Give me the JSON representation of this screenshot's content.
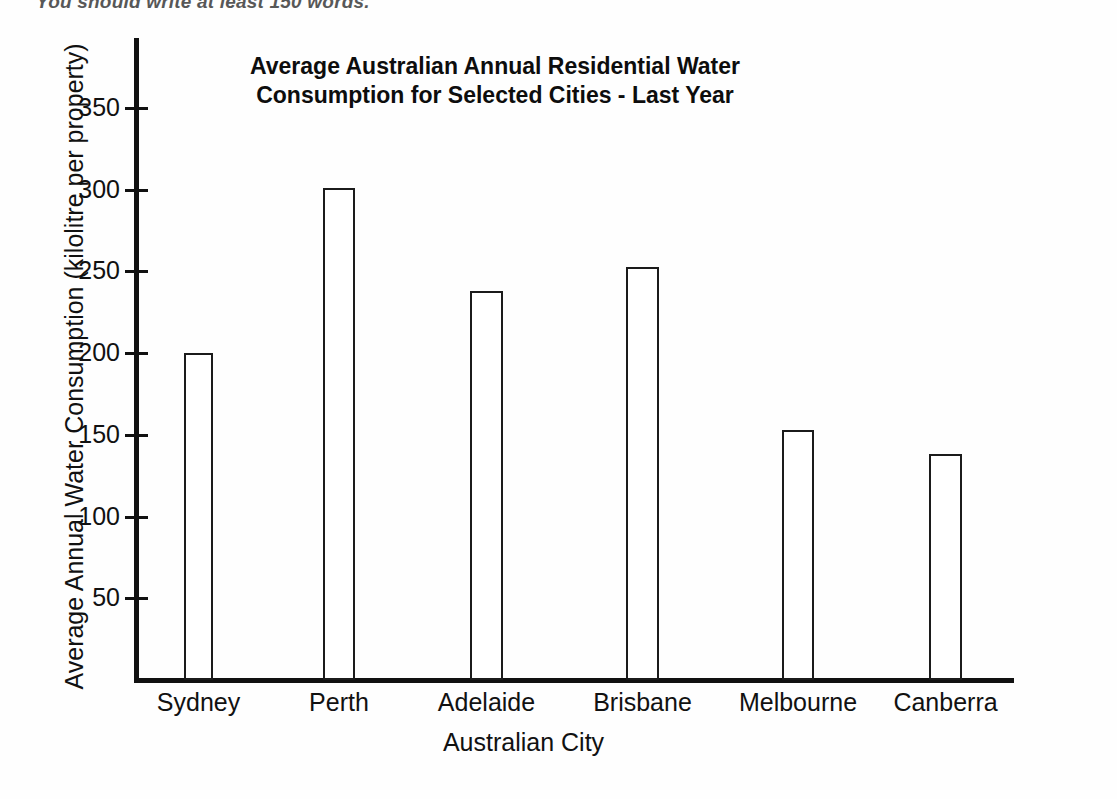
{
  "page": {
    "top_instruction": "You should write at least 150 words."
  },
  "chart_data": {
    "type": "bar",
    "title": "Average Australian Annual Residential Water Consumption for Selected Cities - Last Year",
    "title_line1": "Average Australian Annual Residential Water",
    "title_line2": "Consumption for Selected Cities - Last Year",
    "xlabel": "Australian City",
    "ylabel": "Average Annual Water Consumption (kilolitre per property)",
    "categories": [
      "Sydney",
      "Perth",
      "Adelaide",
      "Brisbane",
      "Melbourne",
      "Canberra"
    ],
    "values": [
      200,
      301,
      238,
      253,
      153,
      138
    ],
    "ylim": [
      0,
      365
    ],
    "yticks": [
      50,
      100,
      150,
      200,
      250,
      300,
      350
    ],
    "ytick_labels": [
      "50",
      "100",
      "150",
      "200",
      "250",
      "300",
      "350"
    ],
    "grid": false,
    "legend": "none",
    "bar_fill": "#ffffff",
    "bar_outline": "#1b1b1b"
  }
}
